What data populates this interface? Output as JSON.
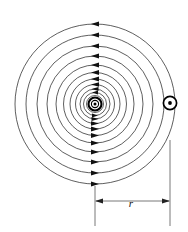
{
  "figure": {
    "background_color": "#ffffff",
    "line_color": "#1a1a1a",
    "dimension_color": "#555555",
    "width": 188,
    "height": 232
  },
  "labels": {
    "radius": "r"
  },
  "symbols": {
    "wire": {
      "name": "current-out-of-page",
      "glyph": "dot-in-circle",
      "cx": 95,
      "cy": 104,
      "outer_radius": 7.2,
      "inner_radius": 4.3,
      "dot_radius": 1.5
    },
    "field_point": {
      "name": "field-point-out-of-page",
      "glyph": "dot-in-circle",
      "cx": 170,
      "cy": 103,
      "ring_radius": 7.0,
      "dot_radius": 1.9
    }
  },
  "field_lines": {
    "direction": "counterclockwise",
    "arrow_x": 95,
    "center_x": 95,
    "center_y": 104,
    "radii": [
      4.0,
      6.0,
      8.5,
      11.5,
      15.0,
      19.5,
      25.0,
      31.5,
      39.0,
      48.0,
      58.0,
      69.0,
      80.0
    ],
    "count": 13
  },
  "dimension": {
    "name": "radius-dimension",
    "label": "r",
    "label_x": 131,
    "label_y": 206,
    "line_y": 201,
    "left_x": 95,
    "right_x": 170,
    "extension_left": {
      "x": 95,
      "y_top": 184,
      "y_bottom": 226
    },
    "extension_right": {
      "x": 170,
      "y_top": 140,
      "y_bottom": 226
    }
  }
}
